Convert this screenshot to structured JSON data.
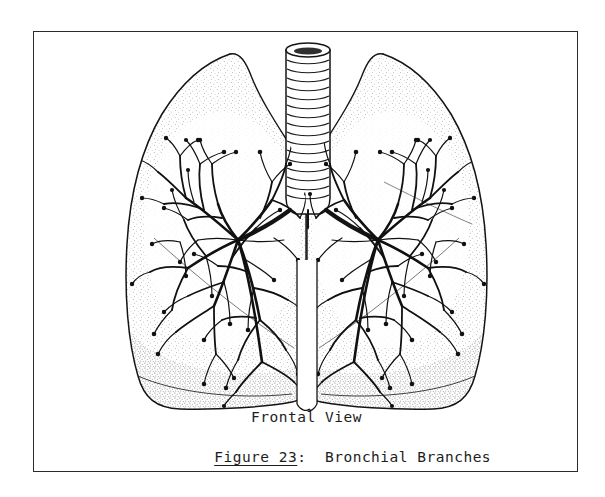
{
  "page": {
    "background_color": "#ffffff",
    "width": 605,
    "height": 497
  },
  "plate": {
    "frame_color": "#2b2b2b",
    "frame_border_width": 1,
    "ink_color": "#111111",
    "fill_color": "#ffffff"
  },
  "caption": {
    "view_label": "Frontal View",
    "figure_number": "Figure 23",
    "colon": ":",
    "gap": "  ",
    "figure_title": "Bronchial Branches",
    "figure_number_underlined": true
  },
  "illustration": {
    "subject": "human lungs with bronchial tree",
    "style": "pen-and-ink stipple line drawing",
    "parts": [
      {
        "name": "trachea",
        "label": "trachea-with-cartilage-rings",
        "ring_count": 18
      },
      {
        "name": "carina",
        "label": "tracheal-bifurcation"
      },
      {
        "name": "left-lung",
        "label": "left-lung-outline"
      },
      {
        "name": "right-lung",
        "label": "right-lung-outline"
      },
      {
        "name": "left-bronchial-tree",
        "label": "left-bronchial-branches"
      },
      {
        "name": "right-bronchial-tree",
        "label": "right-bronchial-branches"
      },
      {
        "name": "stipple-shading",
        "label": "pleural-stipple-texture"
      }
    ]
  }
}
